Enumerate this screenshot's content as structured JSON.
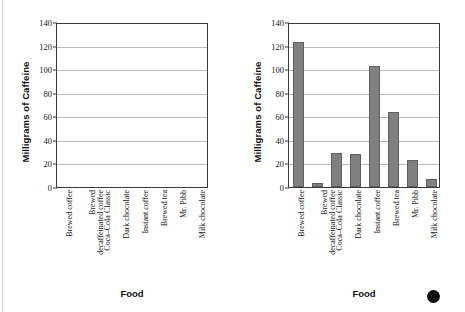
{
  "figure": {
    "bullet_marker": "filled-circle",
    "bar_color": "#808080",
    "bar_border_color": "#606060",
    "gridline_color": "#bdbdbd",
    "axis_color": "#3b3b3b"
  },
  "chart_data": [
    {
      "id": "left",
      "type": "bar",
      "title": "",
      "xlabel": "Food",
      "ylabel": "Milligrams of Caffeine",
      "ylim": [
        0,
        140
      ],
      "yticks": [
        0,
        20,
        40,
        60,
        80,
        100,
        120,
        140
      ],
      "grid": true,
      "legend": "none",
      "categories": [
        "Brewed coffee",
        "Brewed decaffeinated coffee",
        "Coca–Cola Classic",
        "Dark chocolate",
        "Instant coffee",
        "Brewed tea",
        "Mr. Pibb",
        "Milk chocolate"
      ],
      "category_lines": [
        [
          "Brewed coffee"
        ],
        [
          "Brewed",
          "decaffeinated coffee"
        ],
        [
          "Coca–Cola Classic"
        ],
        [
          "Dark chocolate"
        ],
        [
          "Instant coffee"
        ],
        [
          "Brewed tea"
        ],
        [
          "Mr. Pibb"
        ],
        [
          "Milk chocolate"
        ]
      ],
      "values": [
        null,
        null,
        null,
        null,
        null,
        null,
        null,
        null
      ]
    },
    {
      "id": "right",
      "type": "bar",
      "title": "",
      "xlabel": "Food",
      "ylabel": "Milligrams of Caffeine",
      "ylim": [
        0,
        140
      ],
      "yticks": [
        0,
        20,
        40,
        60,
        80,
        100,
        120,
        140
      ],
      "grid": true,
      "legend": "none",
      "categories": [
        "Brewed coffee",
        "Brewed decaffeinated coffee",
        "Coca–Cola Classic",
        "Dark chocolate",
        "Instant coffee",
        "Brewed tea",
        "Mr. Pibb",
        "Milk chocolate"
      ],
      "category_lines": [
        [
          "Brewed coffee"
        ],
        [
          "Brewed",
          "decaffeinated coffee"
        ],
        [
          "Coca–Cola Classic"
        ],
        [
          "Dark chocolate"
        ],
        [
          "Instant coffee"
        ],
        [
          "Brewed tea"
        ],
        [
          "Mr. Pibb"
        ],
        [
          "Milk chocolate"
        ]
      ],
      "values": [
        123,
        3,
        29,
        28,
        103,
        64,
        23,
        7
      ]
    }
  ]
}
